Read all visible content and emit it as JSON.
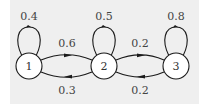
{
  "diagram": {
    "type": "markov-chain",
    "colors": {
      "background": "#efefef",
      "stroke": "#1a1a1a",
      "node_fill": "#ffffff",
      "text": "#444444"
    },
    "nodes": [
      {
        "id": "1",
        "label": "1",
        "self_loop": "0.4"
      },
      {
        "id": "2",
        "label": "2",
        "self_loop": "0.5"
      },
      {
        "id": "3",
        "label": "3",
        "self_loop": "0.8"
      }
    ],
    "edges": [
      {
        "from": "1",
        "to": "2",
        "label": "0.6"
      },
      {
        "from": "2",
        "to": "1",
        "label": "0.3"
      },
      {
        "from": "2",
        "to": "3",
        "label": "0.2"
      },
      {
        "from": "3",
        "to": "2",
        "label": "0.2"
      }
    ]
  }
}
